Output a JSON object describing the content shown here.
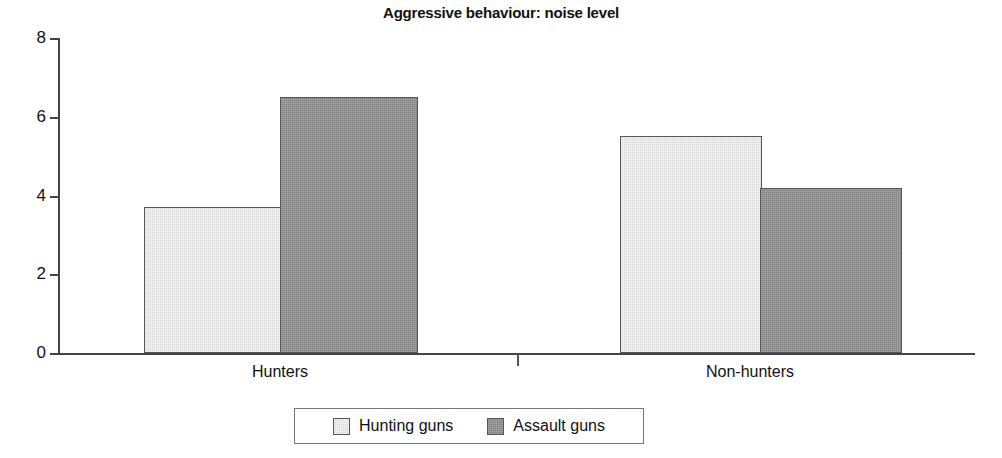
{
  "chart_data": {
    "type": "bar",
    "title": "Aggressive behaviour: noise level",
    "xlabel": "",
    "ylabel": "",
    "categories": [
      "Hunters",
      "Non-hunters"
    ],
    "series": [
      {
        "name": "Hunting guns",
        "values": [
          3.7,
          5.5
        ],
        "color": "#d9d9d9"
      },
      {
        "name": "Assault guns",
        "values": [
          6.5,
          4.2
        ],
        "color": "#828282"
      }
    ],
    "ylim": [
      0,
      8
    ],
    "yticks": [
      0,
      2,
      4,
      6,
      8
    ],
    "ytick_labels": [
      "0",
      "2",
      "4",
      "6",
      "8"
    ],
    "grid": false,
    "legend_position": "bottom-center",
    "legend_boxed": true
  },
  "axes": {
    "y_tick_labels": [
      "8",
      "6",
      "4",
      "2",
      "0"
    ],
    "axis_color": "#444444"
  },
  "legend": {
    "items": [
      {
        "label": "Hunting guns",
        "swatch": "light-gray-swatch"
      },
      {
        "label": "Assault guns",
        "swatch": "dark-gray-swatch"
      }
    ]
  }
}
